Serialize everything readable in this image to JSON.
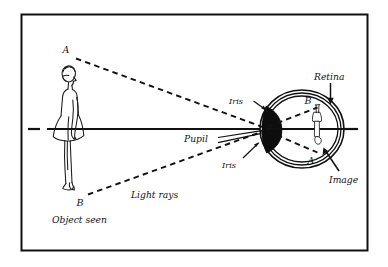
{
  "figure": {
    "title_semantic": "human-eye-vision-ray-diagram",
    "frame": {
      "x": 21,
      "y": 14,
      "width": 347,
      "height": 237,
      "border_color": "#111111",
      "fill_color": "#ffffff"
    },
    "colors": {
      "ink": "#111111",
      "lens_fill": "#0d0d0d",
      "paper": "#ffffff"
    }
  },
  "labels": {
    "object_point_top": "A",
    "object_point_bottom": "B",
    "image_point_top": "B",
    "image_point_bottom": "A",
    "object_caption": "Object seen",
    "light_rays": "Light rays",
    "pupil": "Pupil",
    "iris_upper": "Iris",
    "iris_lower": "Iris",
    "retina": "Retina",
    "image": "Image"
  },
  "diagram_parts": {
    "observer": "standing-woman-in-dress-facing-right",
    "eye": "cross-section-eyeball-three-layers",
    "lens": "filled-black-crystalline-lens",
    "retinal_image": "inverted-miniature-figure-on-retina",
    "optical_axis": "horizontal-solid-line-through-eye",
    "rays": "dashed-light-rays-from-A-and-B-crossing-at-pupil"
  },
  "geometry": {
    "optical_axis_y": 129,
    "axis_left_tick_x": 30,
    "axis_start_x": 47,
    "axis_end_x": 356,
    "pupil_x": 265,
    "pupil_y": 129,
    "eye_center_x": 302,
    "eye_center_y": 129,
    "eye_rx": 42,
    "eye_ry": 39,
    "object_A": [
      71,
      55
    ],
    "object_B": [
      83,
      197
    ],
    "image_B": [
      317,
      105
    ],
    "image_A": [
      320,
      155
    ]
  }
}
